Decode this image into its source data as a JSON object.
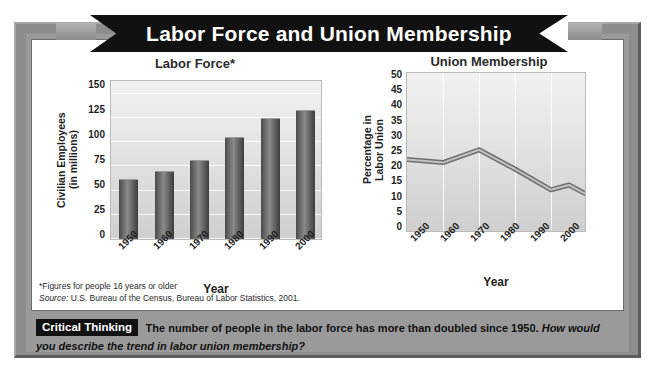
{
  "banner": {
    "title": "Labor Force and Union Membership"
  },
  "charts": [
    {
      "key": "labor_force",
      "title": "Labor Force*",
      "ylabel_line1": "Civilian Employees",
      "ylabel_line2": "(in millions)",
      "xlabel": "Year",
      "yticks": [
        "150",
        "125",
        "100",
        "75",
        "50",
        "25",
        "0"
      ],
      "xticks": [
        "1950",
        "1960",
        "1970",
        "1980",
        "1990",
        "2000"
      ]
    },
    {
      "key": "union_membership",
      "title": "Union Membership",
      "ylabel_line1": "Percentage in",
      "ylabel_line2": "Labor Union",
      "xlabel": "Year",
      "yticks": [
        "50",
        "45",
        "40",
        "35",
        "30",
        "25",
        "20",
        "15",
        "10",
        "5",
        "0"
      ],
      "xticks": [
        "1950",
        "1960",
        "1970",
        "1980",
        "1990",
        "2000"
      ]
    }
  ],
  "notes": {
    "footnote": "*Figures for people 16 years or older",
    "source_label": "Source:",
    "source_text": " U.S. Bureau of the Census, Bureau of Labor Statistics, 2001."
  },
  "critical_thinking": {
    "badge": "Critical Thinking",
    "statement": "The number of people in the labor force has more than doubled since 1950. ",
    "question": "How would you describe the trend in labor union membership?"
  },
  "colors": {
    "frame": "#9a9a9a",
    "ribbon": "#111111",
    "bar": "#5e5e5e",
    "line": "#8f8f8f",
    "plot_bg": "#e3e3e3"
  },
  "chart_data": [
    {
      "type": "bar",
      "title": "Labor Force*",
      "xlabel": "Year",
      "ylabel": "Civilian Employees (in millions)",
      "categories": [
        "1950",
        "1960",
        "1970",
        "1980",
        "1990",
        "2000"
      ],
      "values": [
        62,
        70,
        82,
        105,
        125,
        133
      ],
      "ylim": [
        0,
        165
      ],
      "yticks": [
        0,
        25,
        50,
        75,
        100,
        125,
        150
      ],
      "grid": "horizontal",
      "legend": "none"
    },
    {
      "type": "line",
      "title": "Union Membership",
      "xlabel": "Year",
      "ylabel": "Percentage in Labor Union",
      "x": [
        1950,
        1960,
        1970,
        1980,
        1990,
        1995,
        2000
      ],
      "values": [
        23,
        22,
        26,
        20,
        13.5,
        15,
        12
      ],
      "ylim": [
        0,
        50
      ],
      "yticks": [
        0,
        5,
        10,
        15,
        20,
        25,
        30,
        35,
        40,
        45,
        50
      ],
      "xticks": [
        "1950",
        "1960",
        "1970",
        "1980",
        "1990",
        "2000"
      ],
      "grid": "vertical",
      "legend": "none"
    }
  ]
}
